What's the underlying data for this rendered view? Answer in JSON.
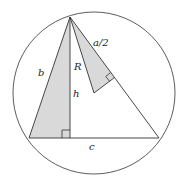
{
  "diagram": {
    "type": "geometry",
    "colors": {
      "stroke": "#333333",
      "shade": "#d9d9d9",
      "background": "#ffffff"
    },
    "labels": {
      "b": "b",
      "R": "R",
      "h": "h",
      "a_half": "a/2",
      "c": "c"
    }
  }
}
